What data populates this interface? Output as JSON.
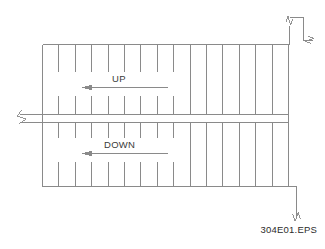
{
  "drawing": {
    "figure_label": "304E01.EPS",
    "line_color": "#8a8a8a",
    "text_color": "#3a3a3a",
    "background_color": "#ffffff",
    "annotations": {
      "up_label": "UP",
      "down_label": "DOWN"
    },
    "flights": {
      "upper": {
        "direction_label": "UP",
        "arrow_direction": "left"
      },
      "lower": {
        "direction_label": "DOWN",
        "arrow_direction": "left"
      }
    },
    "geometry": {
      "outline": {
        "x": 42,
        "y": 44,
        "width": 246,
        "height": 143
      },
      "stringer_band": {
        "x": 20,
        "y": 114,
        "width": 268,
        "height": 9
      },
      "tread_count": 15,
      "break_symbols": 3
    }
  }
}
